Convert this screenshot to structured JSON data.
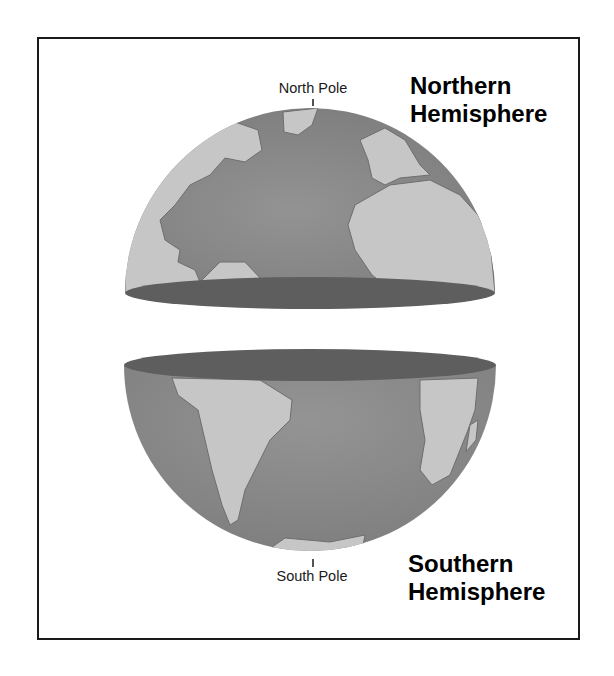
{
  "diagram": {
    "north_pole_label": "North Pole",
    "south_pole_label": "South Pole",
    "northern_label_line1": "Northern",
    "northern_label_line2": "Hemisphere",
    "southern_label_line1": "Southern",
    "southern_label_line2": "Hemisphere"
  },
  "colors": {
    "ocean": "#8c8c8c",
    "land": "#c6c6c6",
    "cut_face": "#5e5e5e",
    "frame": "#1a1a1a"
  }
}
